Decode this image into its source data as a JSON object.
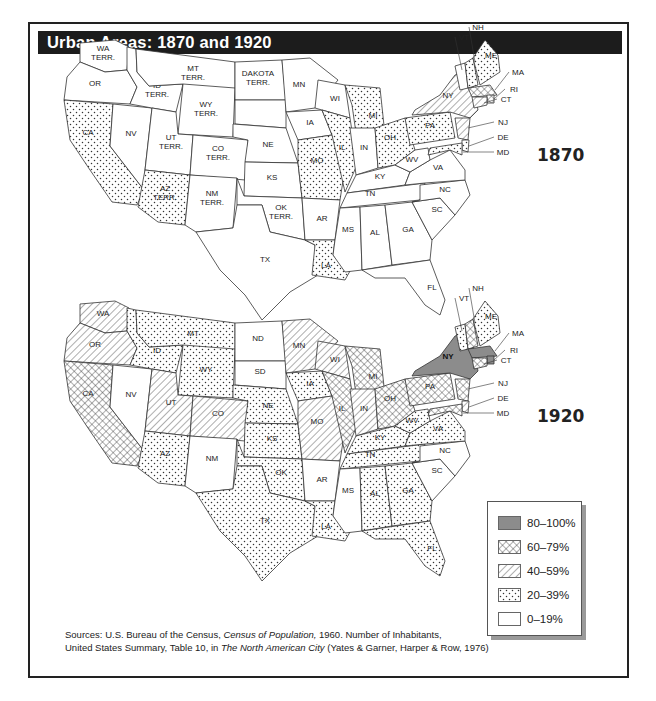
{
  "title": "Urban Areas: 1870 and 1920",
  "maps": [
    {
      "year": "1870",
      "offset_y": 0,
      "states": {
        "WA": {
          "label": [
            "WA",
            "TERR."
          ],
          "cat": "0-19"
        },
        "OR": {
          "label": [
            "OR"
          ],
          "cat": "0-19"
        },
        "CA": {
          "label": [
            "CA"
          ],
          "cat": "20-39"
        },
        "NV": {
          "label": [
            "NV"
          ],
          "cat": "0-19"
        },
        "ID": {
          "label": [
            "ID",
            "TERR."
          ],
          "cat": "0-19"
        },
        "MT": {
          "label": [
            "MT",
            "TERR."
          ],
          "cat": "0-19"
        },
        "WY": {
          "label": [
            "WY",
            "TERR."
          ],
          "cat": "0-19"
        },
        "UT": {
          "label": [
            "UT",
            "TERR."
          ],
          "cat": "0-19"
        },
        "CO": {
          "label": [
            "CO",
            "TERR."
          ],
          "cat": "0-19"
        },
        "AZ": {
          "label": [
            "AZ",
            "TERR."
          ],
          "cat": "20-39"
        },
        "NM": {
          "label": [
            "NM",
            "TERR."
          ],
          "cat": "0-19"
        },
        "DAK_N": {
          "label": [
            "DAKOTA",
            "TERR."
          ],
          "cat": "0-19"
        },
        "DAK_S": {
          "label": [],
          "cat": "0-19"
        },
        "NE": {
          "label": [
            "NE"
          ],
          "cat": "0-19"
        },
        "KS": {
          "label": [
            "KS"
          ],
          "cat": "0-19"
        },
        "OK": {
          "label": [
            "OK",
            "TERR."
          ],
          "cat": "0-19"
        },
        "TX": {
          "label": [
            "TX"
          ],
          "cat": "0-19"
        },
        "MN": {
          "label": [
            "MN"
          ],
          "cat": "0-19"
        },
        "IA": {
          "label": [
            "IA"
          ],
          "cat": "0-19"
        },
        "MO": {
          "label": [
            "MO"
          ],
          "cat": "20-39"
        },
        "AR": {
          "label": [
            "AR"
          ],
          "cat": "0-19"
        },
        "LA": {
          "label": [
            "LA"
          ],
          "cat": "20-39"
        },
        "WI": {
          "label": [
            "WI"
          ],
          "cat": "0-19"
        },
        "IL": {
          "label": [
            "IL"
          ],
          "cat": "20-39"
        },
        "MI": {
          "label": [
            "MI"
          ],
          "cat": "20-39"
        },
        "IN": {
          "label": [
            "IN"
          ],
          "cat": "0-19"
        },
        "OH": {
          "label": [
            "OH"
          ],
          "cat": "20-39"
        },
        "KY": {
          "label": [
            "KY"
          ],
          "cat": "0-19"
        },
        "TN": {
          "label": [
            "TN"
          ],
          "cat": "0-19"
        },
        "MS": {
          "label": [
            "MS"
          ],
          "cat": "0-19"
        },
        "AL": {
          "label": [
            "AL"
          ],
          "cat": "0-19"
        },
        "GA": {
          "label": [
            "GA"
          ],
          "cat": "0-19"
        },
        "FL": {
          "label": [
            "FL"
          ],
          "cat": "0-19"
        },
        "SC": {
          "label": [
            "SC"
          ],
          "cat": "0-19"
        },
        "NC": {
          "label": [
            "NC"
          ],
          "cat": "0-19"
        },
        "VA": {
          "label": [
            "VA"
          ],
          "cat": "0-19"
        },
        "WV": {
          "label": [
            "WV"
          ],
          "cat": "0-19"
        },
        "PA": {
          "label": [
            "PA"
          ],
          "cat": "20-39"
        },
        "NY": {
          "label": [
            "NY"
          ],
          "cat": "40-59"
        },
        "VT": {
          "label": [],
          "cat": "0-19"
        },
        "NH": {
          "label": [],
          "cat": "20-39"
        },
        "ME": {
          "label": [
            "ME"
          ],
          "cat": "20-39"
        },
        "MA": {
          "label": [],
          "cat": "60-79"
        },
        "RI": {
          "label": [],
          "cat": "60-79"
        },
        "CT": {
          "label": [],
          "cat": "40-59"
        },
        "NJ": {
          "label": [],
          "cat": "40-59"
        },
        "DE": {
          "label": [],
          "cat": "20-39"
        },
        "MD": {
          "label": [],
          "cat": "20-39"
        }
      }
    },
    {
      "year": "1920",
      "offset_y": 261,
      "states": {
        "WA": {
          "label": [
            "WA"
          ],
          "cat": "40-59"
        },
        "OR": {
          "label": [
            "OR"
          ],
          "cat": "40-59"
        },
        "CA": {
          "label": [
            "CA"
          ],
          "cat": "60-79"
        },
        "NV": {
          "label": [
            "NV"
          ],
          "cat": "0-19"
        },
        "ID": {
          "label": [
            "ID"
          ],
          "cat": "20-39"
        },
        "MT": {
          "label": [
            "MT"
          ],
          "cat": "20-39"
        },
        "WY": {
          "label": [
            "WY"
          ],
          "cat": "20-39"
        },
        "UT": {
          "label": [
            "UT"
          ],
          "cat": "40-59"
        },
        "CO": {
          "label": [
            "CO"
          ],
          "cat": "40-59"
        },
        "AZ": {
          "label": [
            "AZ"
          ],
          "cat": "20-39"
        },
        "NM": {
          "label": [
            "NM"
          ],
          "cat": "0-19"
        },
        "DAK_N": {
          "label": [
            "ND"
          ],
          "cat": "0-19"
        },
        "DAK_S": {
          "label": [
            "SD"
          ],
          "cat": "0-19"
        },
        "NE": {
          "label": [
            "NE"
          ],
          "cat": "20-39"
        },
        "KS": {
          "label": [
            "KS"
          ],
          "cat": "20-39"
        },
        "OK": {
          "label": [
            "OK"
          ],
          "cat": "20-39"
        },
        "TX": {
          "label": [
            "TX"
          ],
          "cat": "20-39"
        },
        "MN": {
          "label": [
            "MN"
          ],
          "cat": "40-59"
        },
        "IA": {
          "label": [
            "IA"
          ],
          "cat": "20-39"
        },
        "MO": {
          "label": [
            "MO"
          ],
          "cat": "40-59"
        },
        "AR": {
          "label": [
            "AR"
          ],
          "cat": "0-19"
        },
        "LA": {
          "label": [
            "LA"
          ],
          "cat": "20-39"
        },
        "WI": {
          "label": [
            "WI"
          ],
          "cat": "40-59"
        },
        "IL": {
          "label": [
            "IL"
          ],
          "cat": "60-79"
        },
        "MI": {
          "label": [
            "MI"
          ],
          "cat": "60-79"
        },
        "IN": {
          "label": [
            "IN"
          ],
          "cat": "40-59"
        },
        "OH": {
          "label": [
            "OH"
          ],
          "cat": "60-79"
        },
        "KY": {
          "label": [
            "KY"
          ],
          "cat": "20-39"
        },
        "TN": {
          "label": [
            "TN"
          ],
          "cat": "20-39"
        },
        "MS": {
          "label": [
            "MS"
          ],
          "cat": "0-19"
        },
        "AL": {
          "label": [
            "AL"
          ],
          "cat": "20-39"
        },
        "GA": {
          "label": [
            "GA"
          ],
          "cat": "20-39"
        },
        "FL": {
          "label": [
            "FL"
          ],
          "cat": "20-39"
        },
        "SC": {
          "label": [
            "SC"
          ],
          "cat": "0-19"
        },
        "NC": {
          "label": [
            "NC"
          ],
          "cat": "0-19"
        },
        "VA": {
          "label": [
            "VA"
          ],
          "cat": "20-39"
        },
        "WV": {
          "label": [
            "WV"
          ],
          "cat": "20-39"
        },
        "PA": {
          "label": [
            "PA"
          ],
          "cat": "60-79"
        },
        "NY": {
          "label": [
            "NY"
          ],
          "cat": "80-100"
        },
        "VT": {
          "label": [],
          "cat": "20-39"
        },
        "NH": {
          "label": [],
          "cat": "60-79"
        },
        "ME": {
          "label": [
            "ME"
          ],
          "cat": "20-39"
        },
        "MA": {
          "label": [],
          "cat": "80-100"
        },
        "RI": {
          "label": [],
          "cat": "80-100"
        },
        "CT": {
          "label": [],
          "cat": "60-79"
        },
        "NJ": {
          "label": [],
          "cat": "60-79"
        },
        "DE": {
          "label": [],
          "cat": "40-59"
        },
        "MD": {
          "label": [],
          "cat": "60-79"
        }
      }
    }
  ],
  "callouts": [
    "NH",
    "VT",
    "MA",
    "RI",
    "CT",
    "NJ",
    "DE",
    "MD"
  ],
  "legend": {
    "items": [
      {
        "cat": "80-100",
        "label": "80–100%"
      },
      {
        "cat": "60-79",
        "label": "60–79%"
      },
      {
        "cat": "40-59",
        "label": "40–59%"
      },
      {
        "cat": "20-39",
        "label": "20–39%"
      },
      {
        "cat": "0-19",
        "label": "0–19%"
      }
    ]
  },
  "sources": {
    "prefix": "Sources: U.S. Bureau of the Census, ",
    "title1": "Census of Population,",
    "mid": " 1960. Number of Inhabitants,",
    "line2_prefix": "United States Summary, Table 10, in ",
    "title2": "The North American City",
    "line2_suffix": " (Yates & Garner, Harper & Row, 1976)"
  },
  "colors": {
    "title_bar": "#1c1c1c",
    "fill_80_100": "#8c8c8c",
    "stroke": "#333333"
  },
  "chart_data": {
    "type": "choropleth",
    "title": "Urban Areas: 1870 and 1920",
    "measure": "Percent urban population by state",
    "legend": [
      "80–100%",
      "60–79%",
      "40–59%",
      "20–39%",
      "0–19%"
    ],
    "years": {
      "1870": {
        "20-39%": [
          "CA",
          "AZ TERR.",
          "MO",
          "LA",
          "IL",
          "MI",
          "OH",
          "PA",
          "ME",
          "NH",
          "DE",
          "MD"
        ],
        "40-59%": [
          "NY",
          "CT",
          "NJ"
        ],
        "60-79%": [
          "MA",
          "RI"
        ],
        "0-19%": [
          "WA TERR.",
          "OR",
          "NV",
          "ID TERR.",
          "MT TERR.",
          "WY TERR.",
          "UT TERR.",
          "CO TERR.",
          "NM TERR.",
          "DAKOTA TERR.",
          "NE",
          "KS",
          "OK TERR.",
          "TX",
          "MN",
          "IA",
          "AR",
          "WI",
          "IN",
          "KY",
          "TN",
          "MS",
          "AL",
          "GA",
          "FL",
          "SC",
          "NC",
          "VA",
          "WV",
          "VT"
        ]
      },
      "1920": {
        "80-100%": [
          "NY",
          "MA",
          "RI"
        ],
        "60-79%": [
          "CA",
          "IL",
          "MI",
          "OH",
          "PA",
          "NJ",
          "CT",
          "NH",
          "MD"
        ],
        "40-59%": [
          "WA",
          "OR",
          "UT",
          "CO",
          "MN",
          "WI",
          "MO",
          "IN",
          "DE"
        ],
        "20-39%": [
          "ID",
          "MT",
          "WY",
          "AZ",
          "NE",
          "KS",
          "OK",
          "TX",
          "IA",
          "LA",
          "KY",
          "TN",
          "AL",
          "GA",
          "FL",
          "VA",
          "WV",
          "ME",
          "VT"
        ],
        "0-19%": [
          "NV",
          "NM",
          "ND",
          "SD",
          "AR",
          "MS",
          "SC",
          "NC"
        ]
      }
    }
  }
}
